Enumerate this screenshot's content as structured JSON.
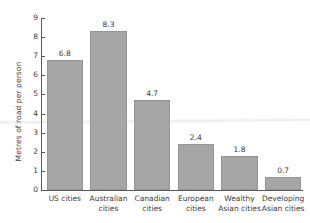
{
  "chart_data": {
    "type": "bar",
    "title": "",
    "xlabel": "",
    "ylabel": "Metres of road per person",
    "categories": [
      "US cities",
      "Australian cities",
      "Canadian cities",
      "European cities",
      "Wealthy Asian cities",
      "Developing Asian cities"
    ],
    "values": [
      6.8,
      8.3,
      4.7,
      2.4,
      1.8,
      0.7
    ],
    "value_labels": [
      "6.8",
      "8.3",
      "4.7",
      "2.4",
      "1.8",
      "0.7"
    ],
    "ylim": [
      0,
      9
    ],
    "yticks": [
      0,
      1,
      2,
      3,
      4,
      5,
      6,
      7,
      8,
      9
    ],
    "ytick_labels": [
      "0",
      "1",
      "2",
      "3",
      "4",
      "5",
      "6",
      "7",
      "8",
      "9"
    ],
    "grid": false,
    "legend": "none",
    "bar_color": "#a6a6a6",
    "bar_edge_color": "#949494",
    "axis_color": "#5a5a5a",
    "text_color": "#3b3b3b",
    "reference_band": {
      "value": 3.2,
      "color": "#eceded",
      "label": ""
    }
  },
  "categories_wrapped": [
    [
      "US cities",
      ""
    ],
    [
      "Australian",
      "cities"
    ],
    [
      "Canadian",
      "cities"
    ],
    [
      "European",
      "cities"
    ],
    [
      "Wealthy",
      "Asian cities"
    ],
    [
      "Developing",
      "Asian cities"
    ]
  ]
}
